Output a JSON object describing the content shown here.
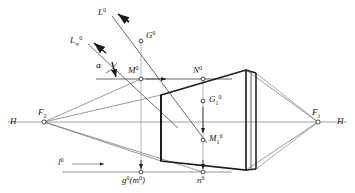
{
  "figure": {
    "type": "perspective-projection-descriptive-geometry",
    "background_color": "#ffffff",
    "ink_color": "#1a1a1a",
    "thin_line_color": "#8a8a8a",
    "width": 355,
    "height": 193
  },
  "labels": {
    "ray_upper": "L",
    "ray_upper_sup": "0",
    "ray_lower": "L",
    "ray_lower_sub": "∞",
    "ray_lower_sup": "0",
    "angle_alpha": "α",
    "point_G0": "G",
    "point_G0_sup": "0",
    "point_M0": "M",
    "point_M0_sup": "0",
    "point_N0": "N",
    "point_N0_sup": "0",
    "point_G1": "G",
    "point_G1_sub": "1",
    "point_G1_sup": "0",
    "point_M1": "M",
    "point_M1_sub": "1",
    "point_M1_sup": "0",
    "vanish_F2": "F",
    "vanish_F2_sub": "2",
    "vanish_F1": "F",
    "vanish_F1_sub": "1",
    "horizon_left": "H",
    "horizon_right": "H",
    "ground_l0": "l",
    "ground_l0_sup": "0",
    "ground_g0": "g",
    "ground_g0_sup": "0",
    "ground_m0_open": "(",
    "ground_m0": "m",
    "ground_m0_sup": "0",
    "ground_m0_close": ")",
    "ground_n0": "n",
    "ground_n0_sup": "0"
  },
  "geometry": {
    "horizon_line": {
      "x1": 8,
      "y1": 122,
      "x2": 347,
      "y2": 122
    },
    "vanishing_points": {
      "F2": {
        "x": 44,
        "y": 122
      },
      "F1": {
        "x": 318,
        "y": 122
      }
    },
    "picture_plane_line": {
      "x1": 96,
      "y1": 79,
      "x2": 232,
      "y2": 79
    },
    "ground_line": {
      "x1": 62,
      "y1": 172,
      "x2": 232,
      "y2": 172
    },
    "points": {
      "G0": {
        "x": 141,
        "y": 41
      },
      "M0": {
        "x": 141,
        "y": 79
      },
      "N0": {
        "x": 203,
        "y": 79
      },
      "G1": {
        "x": 203,
        "y": 101
      },
      "M1": {
        "x": 203,
        "y": 140
      },
      "g0_m0": {
        "x": 141,
        "y": 172
      },
      "n0": {
        "x": 203,
        "y": 172
      }
    },
    "solid_box": {
      "front_top_left": {
        "x": 161,
        "y": 95
      },
      "front_bottom_left": {
        "x": 161,
        "y": 161
      },
      "back_top_left": {
        "x": 246,
        "y": 70
      },
      "back_bottom_left": {
        "x": 246,
        "y": 170
      },
      "right_top": {
        "x": 256,
        "y": 73
      },
      "right_bottom": {
        "x": 256,
        "y": 169
      }
    },
    "rays": {
      "L0_start": {
        "x": 112,
        "y": 16
      },
      "L0_end": {
        "x": 207,
        "y": 143
      },
      "Linf0_start": {
        "x": 88,
        "y": 44
      },
      "Linf0_end": {
        "x": 178,
        "y": 128
      }
    },
    "arrows": {
      "l0_arrow": {
        "from_x": 72,
        "from_y": 164,
        "to_x": 104,
        "to_y": 164
      },
      "M0_arrow": {
        "from_x": 145,
        "from_y": 79,
        "to_x": 164,
        "to_y": 79
      },
      "G1M1_arrow": {
        "from_x": 203,
        "from_y": 106,
        "to_x": 203,
        "to_y": 134
      },
      "g0_arrow": {
        "from_x": 141,
        "from_y": 161,
        "to_x": 141,
        "to_y": 170
      },
      "n0_arrow": {
        "from_x": 203,
        "from_y": 161,
        "to_x": 203,
        "to_y": 170
      }
    }
  }
}
